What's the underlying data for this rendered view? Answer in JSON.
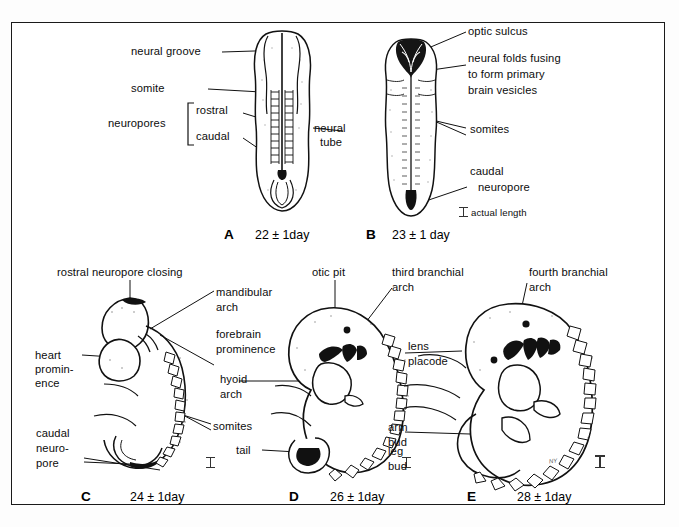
{
  "figure": {
    "ink_color": "#111111",
    "frame_color": "#1a1a1a"
  },
  "panels": [
    {
      "id": "A",
      "letter": "A",
      "caption": "22 ± 1day",
      "scale_note": "",
      "labels": [
        {
          "name": "neural-groove",
          "text": "neural groove"
        },
        {
          "name": "somite",
          "text": "somite"
        },
        {
          "name": "neuropores",
          "text": "neuropores"
        },
        {
          "name": "rostral",
          "text": "rostral"
        },
        {
          "name": "caudal",
          "text": "caudal"
        },
        {
          "name": "neural-tube",
          "text": "neural\ntube"
        }
      ]
    },
    {
      "id": "B",
      "letter": "B",
      "caption": "23 ± 1 day",
      "scale_note": "actual length",
      "labels": [
        {
          "name": "optic-sulcus",
          "text": "optic sulcus"
        },
        {
          "name": "neural-folds-fusing",
          "text": "neural folds fusing\nto form primary\nbrain vesicles"
        },
        {
          "name": "somites",
          "text": "somites"
        },
        {
          "name": "caudal-neuropore",
          "text": "caudal\n  neuropore"
        }
      ]
    },
    {
      "id": "C",
      "letter": "C",
      "caption": "24 ± 1day",
      "scale_note": "",
      "labels": [
        {
          "name": "rostral-neuropore-closing",
          "text": "rostral neuropore closing"
        },
        {
          "name": "mandibular-arch",
          "text": "mandibular\narch"
        },
        {
          "name": "forebrain-prominence",
          "text": "forebrain\nprominence"
        },
        {
          "name": "hyoid-arch",
          "text": "hyoid\narch"
        },
        {
          "name": "heart-prominence",
          "text": "heart\npromin-\nence"
        },
        {
          "name": "somites",
          "text": "somites"
        },
        {
          "name": "caudal-neuropore",
          "text": "caudal\nneuro-\npore"
        }
      ]
    },
    {
      "id": "D",
      "letter": "D",
      "caption": "26 ± 1day",
      "scale_note": "",
      "labels": [
        {
          "name": "otic-pit",
          "text": "otic pit"
        },
        {
          "name": "third-branchial-arch",
          "text": "third branchial\narch"
        },
        {
          "name": "arm-bud",
          "text": "arm\nbud"
        },
        {
          "name": "tail",
          "text": "tail"
        }
      ]
    },
    {
      "id": "E",
      "letter": "E",
      "caption": "28 ± 1day",
      "scale_note": "",
      "labels": [
        {
          "name": "fourth-branchial-arch",
          "text": "fourth branchial\narch"
        },
        {
          "name": "lens-placode",
          "text": "lens\nplacode"
        },
        {
          "name": "leg-bud",
          "text": "leg\nbud"
        }
      ]
    }
  ],
  "text": {
    "neural_groove": "neural groove",
    "somite": "somite",
    "neuropores": "neuropores",
    "rostral": "rostral",
    "caudal": "caudal",
    "neural_tube_l1": "neural",
    "neural_tube_l2": "tube",
    "optic_sulcus": "optic sulcus",
    "folds_l1": "neural folds fusing",
    "folds_l2": "to form primary",
    "folds_l3": "brain vesicles",
    "somites_b": "somites",
    "caudal_b1": "caudal",
    "caudal_b2": "neuropore",
    "actual_length": "actual length",
    "rostral_closing": "rostral neuropore closing",
    "mandibular_1": "mandibular",
    "mandibular_2": "arch",
    "forebrain_1": "forebrain",
    "forebrain_2": "prominence",
    "hyoid_1": "hyoid",
    "hyoid_2": "arch",
    "heart_1": "heart",
    "heart_2": "promin-",
    "heart_3": "ence",
    "somites_c": "somites",
    "caudal_c1": "caudal",
    "caudal_c2": "neuro-",
    "caudal_c3": "pore",
    "otic_pit": "otic pit",
    "third_1": "third branchial",
    "third_2": "arch",
    "arm_1": "arm",
    "arm_2": "bud",
    "tail": "tail",
    "fourth_1": "fourth branchial",
    "fourth_2": "arch",
    "lens_1": "lens",
    "lens_2": "placode",
    "leg_1": "leg",
    "leg_2": "bud",
    "cap_a": "22 ± 1day",
    "cap_b": "23 ± 1 day",
    "cap_c": "24 ± 1day",
    "cap_d": "26 ± 1day",
    "cap_e": "28 ± 1day",
    "letter_a": "A",
    "letter_b": "B",
    "letter_c": "C",
    "letter_d": "D",
    "letter_e": "E",
    "signature": "NY"
  }
}
